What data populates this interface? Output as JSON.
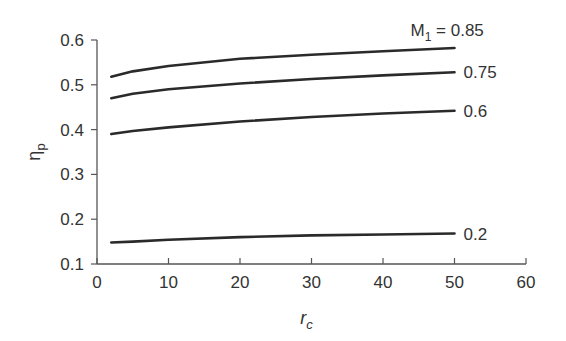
{
  "chart_data": {
    "type": "line",
    "title": "",
    "xlabel": "r_c",
    "ylabel": "η_p",
    "xlim": [
      0,
      60
    ],
    "ylim": [
      0.1,
      0.6
    ],
    "xticks": [
      "0",
      "10",
      "20",
      "30",
      "40",
      "50",
      "60"
    ],
    "yticks": [
      "0.1",
      "0.2",
      "0.3",
      "0.4",
      "0.5",
      "0.6"
    ],
    "grid": false,
    "legend": "inline labels at right end of each curve",
    "x": [
      2,
      5,
      10,
      20,
      30,
      40,
      50
    ],
    "series": [
      {
        "name": "M1 = 0.85",
        "label": "M₁ = 0.85",
        "values": [
          0.518,
          0.53,
          0.542,
          0.558,
          0.567,
          0.575,
          0.582
        ]
      },
      {
        "name": "0.75",
        "label": "0.75",
        "values": [
          0.47,
          0.48,
          0.49,
          0.503,
          0.513,
          0.521,
          0.528
        ]
      },
      {
        "name": "0.6",
        "label": "0.6",
        "values": [
          0.39,
          0.397,
          0.405,
          0.418,
          0.428,
          0.436,
          0.442
        ]
      },
      {
        "name": "0.2",
        "label": "0.2",
        "values": [
          0.148,
          0.15,
          0.154,
          0.16,
          0.164,
          0.166,
          0.168
        ]
      }
    ]
  }
}
